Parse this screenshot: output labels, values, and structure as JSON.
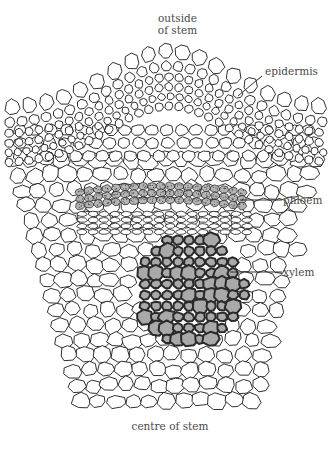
{
  "diagram": {
    "title_top": [
      "outside",
      "of stem"
    ],
    "title_bottom": "centre of stem",
    "labels": {
      "epidermis": "epidermis",
      "phloem": "phloem",
      "xylem": "xylem"
    },
    "colors": {
      "outline": "#1a1a1a",
      "phloem_fill": "#b5b5b5",
      "xylem_fill": "#a9a9a9",
      "xylem_wall": "#2a2a2a",
      "label_text": "#4a4a4a",
      "background": "#ffffff"
    }
  }
}
